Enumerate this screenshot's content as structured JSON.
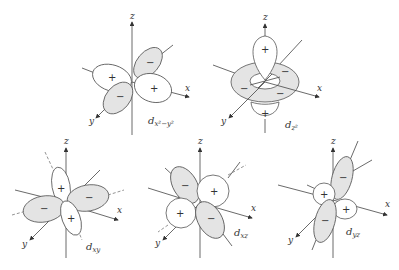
{
  "figure": {
    "axes": {
      "x": "x",
      "y": "y",
      "z": "z"
    },
    "signs": {
      "positive": "+",
      "negative": "−"
    },
    "colors": {
      "positive_lobe": "#ffffff",
      "negative_lobe": "#e4e4e4",
      "outline": "#555555"
    },
    "orbitals": [
      {
        "id": "dx2-y2",
        "name": "d",
        "subscript": "x²−y²",
        "lobes": [
          "+",
          "−",
          "+",
          "−"
        ]
      },
      {
        "id": "dz2",
        "name": "d",
        "subscript": "z²",
        "lobes": [
          "+",
          "+",
          "−",
          "−",
          "−",
          "−"
        ]
      },
      {
        "id": "dxy",
        "name": "d",
        "subscript": "xy",
        "lobes": [
          "+",
          "−",
          "−",
          "+"
        ]
      },
      {
        "id": "dxz",
        "name": "d",
        "subscript": "xz",
        "lobes": [
          "−",
          "+",
          "+",
          "−"
        ]
      },
      {
        "id": "dyz",
        "name": "d",
        "subscript": "yz",
        "lobes": [
          "−",
          "+",
          "+",
          "−"
        ]
      }
    ]
  }
}
